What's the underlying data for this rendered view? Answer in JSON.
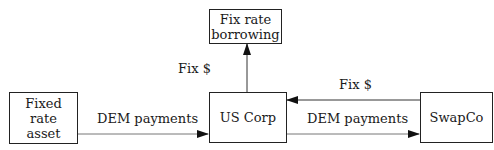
{
  "nodes": {
    "fix_rate_borrowing": {
      "label": "Fix rate\nborrowing",
      "line1": "Fix rate",
      "line2": "borrowing"
    },
    "fixed_rate_asset": {
      "label": "Fixed rate asset",
      "line1": "Fixed",
      "line2": "rate",
      "line3": "asset"
    },
    "us_corp": {
      "label": "US Corp"
    },
    "swapco": {
      "label": "SwapCo"
    }
  },
  "edges": [
    {
      "from": "us_corp",
      "to": "fix_rate_borrowing",
      "label": "Fix $"
    },
    {
      "from": "fixed_rate_asset",
      "to": "us_corp",
      "label": "DEM payments"
    },
    {
      "from": "swapco",
      "to": "us_corp",
      "label": "Fix $"
    },
    {
      "from": "us_corp",
      "to": "swapco",
      "label": "DEM payments"
    }
  ]
}
